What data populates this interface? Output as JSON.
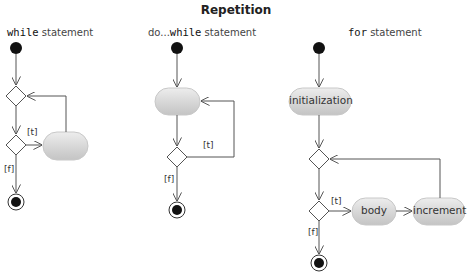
{
  "title": "Repetition",
  "diagrams": {
    "while": {
      "keyword": "while",
      "suffix": " statement",
      "guard_true": "[t]",
      "guard_false": "[f]",
      "activity_label": ""
    },
    "do_while": {
      "keyword": "do...while",
      "keyword_prefix": "do...",
      "keyword_mono": "while",
      "suffix": " statement",
      "guard_true": "[t]",
      "guard_false": "[f]",
      "activity_label": ""
    },
    "for": {
      "keyword": "for",
      "suffix": " statement",
      "guard_true": "[t]",
      "guard_false": "[f]",
      "activities": {
        "initialization": "initialization",
        "body": "body",
        "increment": "increment"
      }
    }
  },
  "colors": {
    "activity_fill": "#d4d4d4",
    "activity_highlight": "#ececec",
    "line": "#555555",
    "node": "#111111"
  }
}
